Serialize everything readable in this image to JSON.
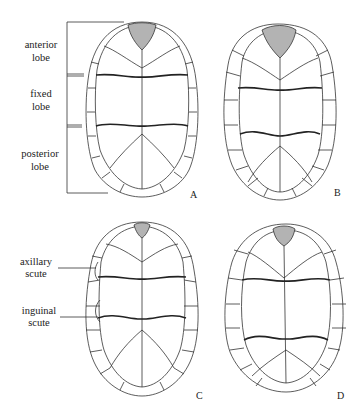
{
  "figure": {
    "panels": [
      {
        "id": "A",
        "label": "A"
      },
      {
        "id": "B",
        "label": "B"
      },
      {
        "id": "C",
        "label": "C"
      },
      {
        "id": "D",
        "label": "D"
      }
    ],
    "annotations": {
      "anterior_lobe": [
        "anterior",
        "lobe"
      ],
      "fixed_lobe": [
        "fixed",
        "lobe"
      ],
      "posterior_lobe": [
        "posterior",
        "lobe"
      ],
      "axillary_scute": [
        "axillary",
        "scute"
      ],
      "inguinal_scute": [
        "inguinal",
        "scute"
      ]
    },
    "colors": {
      "shaded_scute": "#b3b3b3",
      "line": "#333333",
      "background": "#ffffff"
    }
  }
}
